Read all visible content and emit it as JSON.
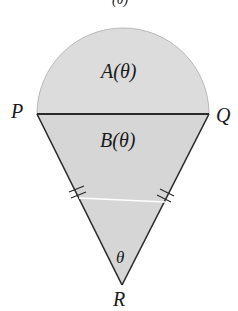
{
  "diagram": {
    "top_cut_text": "(θ)",
    "semicircle_label": "A(θ)",
    "triangle_label": "B(θ)",
    "angle_label": "θ",
    "vertices": {
      "P": "P",
      "Q": "Q",
      "R": "R"
    },
    "colors": {
      "semicircle_fill": "#dcdcdc",
      "triangle_fill": "#d6d6d6",
      "stroke": "#2a2a2a",
      "semicircle_edge": "#b8b8b8",
      "midline": "#ffffff"
    },
    "tick_marks": "double tick marks on PR and QR indicating equal halves"
  }
}
